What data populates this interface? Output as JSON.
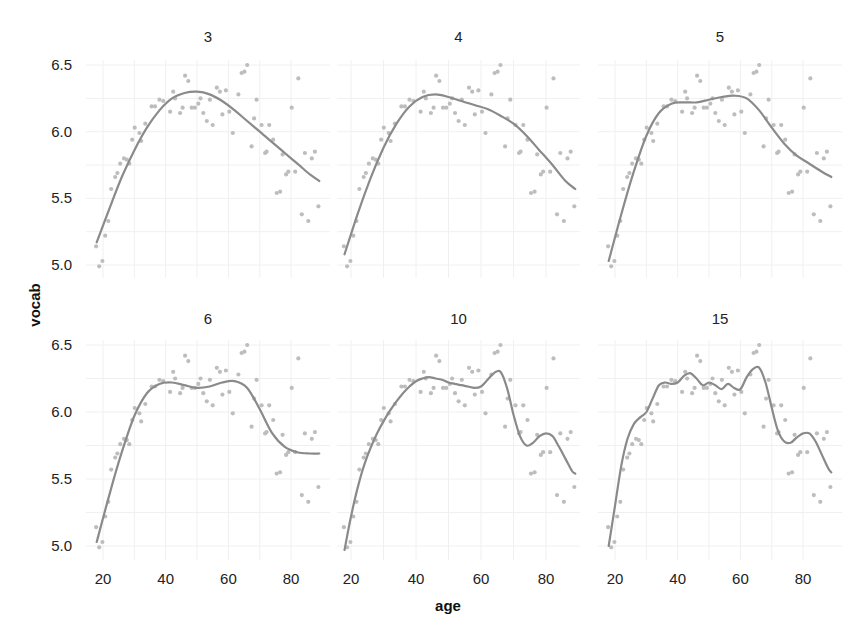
{
  "chart_data": {
    "type": "scatter",
    "title": "",
    "xlabel": "age",
    "ylabel": "vocab",
    "xlim": [
      17,
      90
    ],
    "ylim": [
      4.95,
      6.55
    ],
    "x_ticks": [
      20,
      40,
      60,
      80
    ],
    "y_ticks": [
      5.0,
      5.5,
      6.0,
      6.5
    ],
    "y_tick_labels": [
      "5.0",
      "5.5",
      "6.0",
      "6.5"
    ],
    "grid": true,
    "legend": null,
    "facet_variable": "spline degrees of freedom",
    "points": {
      "age": [
        17.8,
        18.8,
        19.8,
        20.7,
        21.7,
        22.6,
        23.9,
        24.6,
        25.5,
        26.7,
        27.6,
        28.4,
        29.3,
        30.1,
        31.6,
        32.2,
        33.5,
        35.5,
        36.6,
        38.0,
        39.2,
        41.4,
        42.4,
        43.0,
        44.6,
        45.4,
        46.2,
        47.2,
        48.3,
        49.3,
        50.4,
        51.1,
        52.0,
        53.1,
        54.1,
        55.0,
        56.3,
        57.3,
        58.1,
        59.2,
        60.3,
        61.4,
        63.2,
        64.2,
        65.1,
        66.0,
        67.4,
        68.2,
        69.0,
        70.6,
        71.7,
        72.2,
        73.0,
        74.3,
        75.4,
        76.5,
        77.3,
        78.4,
        79.1,
        80.2,
        81.3,
        82.3,
        83.4,
        84.4,
        85.5,
        86.6,
        87.6,
        88.7
      ],
      "vocab": [
        5.14,
        4.99,
        5.03,
        5.22,
        5.33,
        5.57,
        5.66,
        5.69,
        5.76,
        5.8,
        5.79,
        5.76,
        5.94,
        6.03,
        5.99,
        5.93,
        6.06,
        6.19,
        6.19,
        6.24,
        6.23,
        6.15,
        6.3,
        6.25,
        6.14,
        6.18,
        6.42,
        6.38,
        6.18,
        6.18,
        6.21,
        6.25,
        6.14,
        6.08,
        6.24,
        6.05,
        6.33,
        6.3,
        6.13,
        6.31,
        6.15,
        5.99,
        6.28,
        6.44,
        6.45,
        6.5,
        5.89,
        6.1,
        6.24,
        6.05,
        5.84,
        5.85,
        6.05,
        5.94,
        5.54,
        5.55,
        5.83,
        5.68,
        5.7,
        6.18,
        5.7,
        6.4,
        5.38,
        5.84,
        5.33,
        5.8,
        5.85,
        5.44
      ]
    },
    "series": [
      {
        "name": "3",
        "panel": 0,
        "x": [
          18,
          22,
          26,
          30,
          34,
          38,
          42,
          46,
          50,
          54,
          58,
          62,
          66,
          70,
          74,
          78,
          82,
          86,
          89
        ],
        "y": [
          5.17,
          5.42,
          5.66,
          5.86,
          6.03,
          6.16,
          6.25,
          6.29,
          6.3,
          6.28,
          6.23,
          6.16,
          6.08,
          6.0,
          5.92,
          5.84,
          5.76,
          5.68,
          5.63
        ]
      },
      {
        "name": "4",
        "panel": 1,
        "x": [
          18,
          22,
          26,
          30,
          34,
          38,
          42,
          46,
          50,
          54,
          58,
          62,
          66,
          70,
          74,
          78,
          82,
          86,
          89
        ],
        "y": [
          5.08,
          5.38,
          5.65,
          5.88,
          6.06,
          6.19,
          6.26,
          6.28,
          6.26,
          6.23,
          6.2,
          6.17,
          6.12,
          6.06,
          5.97,
          5.86,
          5.75,
          5.63,
          5.57
        ]
      },
      {
        "name": "5",
        "panel": 2,
        "x": [
          18,
          22,
          26,
          30,
          34,
          38,
          42,
          46,
          50,
          54,
          58,
          62,
          66,
          70,
          74,
          78,
          82,
          86,
          89
        ],
        "y": [
          5.03,
          5.38,
          5.7,
          5.97,
          6.14,
          6.21,
          6.22,
          6.22,
          6.24,
          6.26,
          6.27,
          6.25,
          6.16,
          6.03,
          5.91,
          5.82,
          5.76,
          5.7,
          5.66
        ]
      },
      {
        "name": "6",
        "panel": 3,
        "x": [
          18,
          22,
          26,
          30,
          34,
          38,
          42,
          46,
          50,
          54,
          58,
          62,
          66,
          70,
          74,
          78,
          82,
          86,
          89
        ],
        "y": [
          5.03,
          5.38,
          5.7,
          5.97,
          6.14,
          6.21,
          6.22,
          6.2,
          6.18,
          6.19,
          6.22,
          6.23,
          6.18,
          6.02,
          5.84,
          5.74,
          5.7,
          5.69,
          5.69
        ]
      },
      {
        "name": "10",
        "panel": 4,
        "x": [
          18,
          20,
          22,
          24,
          26,
          28,
          30,
          32,
          34,
          36,
          38,
          40,
          42,
          44,
          46,
          48,
          50,
          52,
          54,
          56,
          58,
          60,
          62,
          64,
          66,
          68,
          70,
          72,
          74,
          76,
          78,
          80,
          82,
          84,
          86,
          88,
          89
        ],
        "y": [
          4.97,
          5.22,
          5.43,
          5.6,
          5.73,
          5.84,
          5.93,
          6.01,
          6.08,
          6.14,
          6.19,
          6.23,
          6.25,
          6.26,
          6.25,
          6.24,
          6.22,
          6.21,
          6.2,
          6.19,
          6.18,
          6.19,
          6.24,
          6.29,
          6.3,
          6.18,
          5.98,
          5.82,
          5.75,
          5.77,
          5.82,
          5.84,
          5.82,
          5.74,
          5.65,
          5.56,
          5.54
        ]
      },
      {
        "name": "15",
        "panel": 5,
        "x": [
          18,
          20,
          22,
          24,
          26,
          28,
          30,
          32,
          34,
          36,
          38,
          40,
          42,
          44,
          46,
          48,
          50,
          52,
          54,
          56,
          58,
          60,
          62,
          64,
          66,
          68,
          70,
          72,
          74,
          76,
          78,
          80,
          82,
          84,
          86,
          88,
          89
        ],
        "y": [
          5.0,
          5.3,
          5.6,
          5.8,
          5.91,
          5.96,
          6.0,
          6.1,
          6.2,
          6.22,
          6.21,
          6.22,
          6.27,
          6.29,
          6.25,
          6.2,
          6.22,
          6.2,
          6.17,
          6.21,
          6.18,
          6.17,
          6.26,
          6.32,
          6.33,
          6.22,
          6.03,
          5.86,
          5.78,
          5.77,
          5.81,
          5.84,
          5.84,
          5.78,
          5.68,
          5.58,
          5.55
        ]
      }
    ],
    "panels": [
      {
        "title": "3",
        "row": 0,
        "col": 0
      },
      {
        "title": "4",
        "row": 0,
        "col": 1
      },
      {
        "title": "5",
        "row": 0,
        "col": 2
      },
      {
        "title": "6",
        "row": 1,
        "col": 0
      },
      {
        "title": "10",
        "row": 1,
        "col": 1
      },
      {
        "title": "15",
        "row": 1,
        "col": 2
      }
    ],
    "colors": {
      "points": "#bdbdbd",
      "smooth": "#8a8a8a",
      "grid": "#f0f0f0",
      "text": "#222222"
    }
  },
  "labels": {
    "xlabel": "age",
    "ylabel": "vocab",
    "panel_titles": [
      "3",
      "4",
      "5",
      "6",
      "10",
      "15"
    ]
  }
}
